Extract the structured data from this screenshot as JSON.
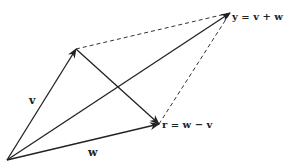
{
  "diagram": {
    "colors": {
      "stroke": "#222222",
      "dashed": "#333333",
      "background": "#ffffff"
    },
    "points": {
      "origin": [
        7,
        160
      ],
      "v_tip": [
        76,
        49
      ],
      "w_tip": [
        159,
        124
      ],
      "y_tip": [
        230,
        13
      ]
    },
    "labels": {
      "v": "v",
      "w": "w",
      "y": "y = v + w",
      "r": "r = w − v"
    }
  }
}
